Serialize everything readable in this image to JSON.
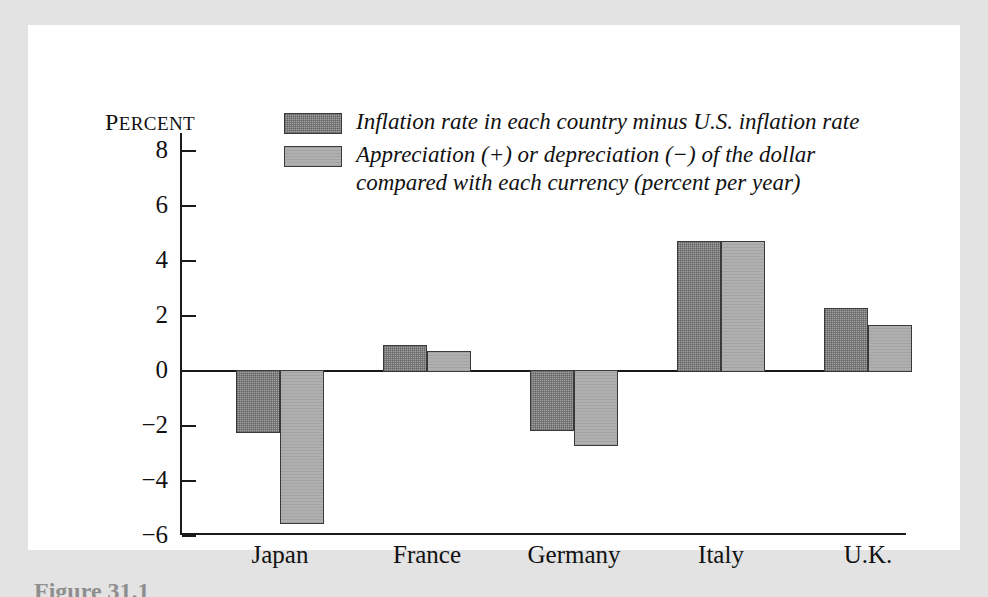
{
  "figure": {
    "caption": "Figure 31.1"
  },
  "chart_data": {
    "type": "bar",
    "title": "",
    "xlabel": "",
    "ylabel": "Percent",
    "ylabel_display": "Percent",
    "ylim": [
      -6,
      8
    ],
    "yticks": [
      8,
      6,
      4,
      2,
      0,
      -2,
      -4,
      -6
    ],
    "ytick_labels": [
      "8",
      "6",
      "4",
      "2",
      "0",
      "−2",
      "−4",
      "−6"
    ],
    "grid": false,
    "legend_position": "top-center",
    "categories": [
      "Japan",
      "France",
      "Germany",
      "Italy",
      "U.K."
    ],
    "series": [
      {
        "name": "Inflation rate in each country minus U.S. inflation rate",
        "color": "#a3a3a3",
        "values": [
          -2.3,
          0.9,
          -2.2,
          4.7,
          2.25
        ]
      },
      {
        "name": "Appreciation (+) or depreciation (−) of the dollar\ncompared with each currency (percent per year)",
        "color": "#b0b0b0",
        "values": [
          -5.6,
          0.7,
          -2.75,
          4.7,
          1.65
        ]
      }
    ]
  }
}
